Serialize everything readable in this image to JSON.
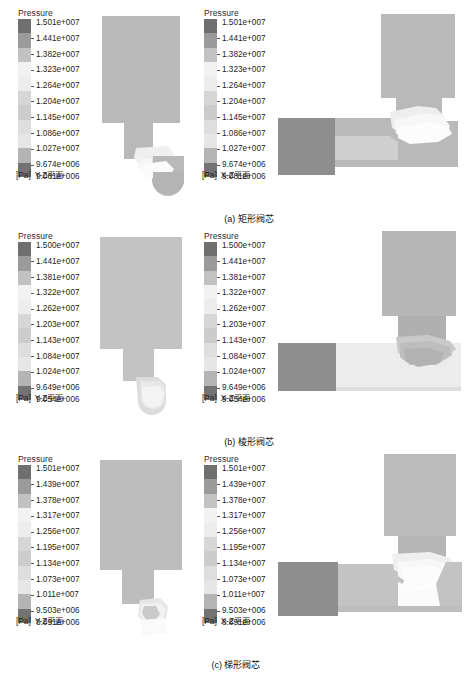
{
  "figure": {
    "type": "cfd-pressure-contour-figure",
    "rows": [
      {
        "id": "a",
        "caption": "(a) 矩形阀芯",
        "panels": [
          {
            "view": "Y-Z平面",
            "unit": "[Pa]",
            "legend_title": "Pressure",
            "levels": [
              "1.501e+007",
              "1.441e+007",
              "1.382e+007",
              "1.323e+007",
              "1.264e+007",
              "1.204e+007",
              "1.145e+007",
              "1.086e+007",
              "1.027e+007",
              "9.674e+006",
              "9.081e+006"
            ]
          },
          {
            "view": "X-Z平面",
            "unit": "[Pa]",
            "legend_title": "Pressure",
            "levels": [
              "1.501e+007",
              "1.441e+007",
              "1.382e+007",
              "1.323e+007",
              "1.264e+007",
              "1.204e+007",
              "1.145e+007",
              "1.086e+007",
              "1.027e+007",
              "9.674e+006",
              "9.081e+006"
            ]
          }
        ]
      },
      {
        "id": "b",
        "caption": "(b) 棱形阀芯",
        "panels": [
          {
            "view": "Y-Z平面",
            "unit": "[Pa]",
            "legend_title": "Pressure",
            "levels": [
              "1.500e+007",
              "1.441e+007",
              "1.381e+007",
              "1.322e+007",
              "1.262e+007",
              "1.203e+007",
              "1.143e+007",
              "1.084e+007",
              "1.024e+007",
              "9.649e+006",
              "9.054e+006"
            ]
          },
          {
            "view": "X-Z平面",
            "unit": "[Pa]",
            "legend_title": "Pressure",
            "levels": [
              "1.500e+007",
              "1.441e+007",
              "1.381e+007",
              "1.322e+007",
              "1.262e+007",
              "1.203e+007",
              "1.143e+007",
              "1.084e+007",
              "1.024e+007",
              "9.649e+006",
              "9.054e+006"
            ]
          }
        ]
      },
      {
        "id": "c",
        "caption": "(c) 梯形阀芯",
        "panels": [
          {
            "view": "Y-Z平面",
            "unit": "[Pa]",
            "legend_title": "Pressure",
            "levels": [
              "1.501e+007",
              "1.439e+007",
              "1.378e+007",
              "1.317e+007",
              "1.256e+007",
              "1.195e+007",
              "1.134e+007",
              "1.073e+007",
              "1.011e+007",
              "9.503e+006",
              "8.891e+006"
            ]
          },
          {
            "view": "X-Z平面",
            "unit": "[Pa]",
            "legend_title": "Pressure",
            "levels": [
              "1.501e+007",
              "1.439e+007",
              "1.378e+007",
              "1.317e+007",
              "1.256e+007",
              "1.195e+007",
              "1.134e+007",
              "1.073e+007",
              "1.011e+007",
              "9.503e+006",
              "8.891e+006"
            ]
          }
        ]
      }
    ],
    "colorbar_swatches": [
      "#6f6f6f",
      "#9b9b9b",
      "#c2c2c2",
      "#f2f2f2",
      "#ededed",
      "#d6d6d6",
      "#cccccc",
      "#dedede",
      "#e6e6e6",
      "#b4b4b4",
      "#737373"
    ],
    "body_fill": "#b9b9b9",
    "inlet_fill": "#8e8e8e",
    "throat_fill": "#ededed",
    "mid_fill": "#cfcfcf"
  },
  "chart_data": {
    "type": "heatmap",
    "title": "",
    "xlabel": "",
    "ylabel": "",
    "subplots": [
      {
        "label": "(a) 矩形阀芯 — Y-Z平面",
        "variable": "Pressure",
        "unit": "Pa",
        "contour_levels": [
          15010000,
          14410000,
          13820000,
          13230000,
          12640000,
          12040000,
          11450000,
          10860000,
          10270000,
          9674000,
          9081000
        ],
        "range": [
          9081000,
          15010000
        ]
      },
      {
        "label": "(a) 矩形阀芯 — X-Z平面",
        "variable": "Pressure",
        "unit": "Pa",
        "contour_levels": [
          15010000,
          14410000,
          13820000,
          13230000,
          12640000,
          12040000,
          11450000,
          10860000,
          10270000,
          9674000,
          9081000
        ],
        "range": [
          9081000,
          15010000
        ]
      },
      {
        "label": "(b) 棱形阀芯 — Y-Z平面",
        "variable": "Pressure",
        "unit": "Pa",
        "contour_levels": [
          15000000,
          14410000,
          13810000,
          13220000,
          12620000,
          12030000,
          11430000,
          10840000,
          10240000,
          9649000,
          9054000
        ],
        "range": [
          9054000,
          15000000
        ]
      },
      {
        "label": "(b) 棱形阀芯 — X-Z平面",
        "variable": "Pressure",
        "unit": "Pa",
        "contour_levels": [
          15000000,
          14410000,
          13810000,
          13220000,
          12620000,
          12030000,
          11430000,
          10840000,
          10240000,
          9649000,
          9054000
        ],
        "range": [
          9054000,
          15000000
        ]
      },
      {
        "label": "(c) 梯形阀芯 — Y-Z平面",
        "variable": "Pressure",
        "unit": "Pa",
        "contour_levels": [
          15010000,
          14390000,
          13780000,
          13170000,
          12560000,
          11950000,
          11340000,
          10730000,
          10110000,
          9503000,
          8891000
        ],
        "range": [
          8891000,
          15010000
        ]
      },
      {
        "label": "(c) 梯形阀芯 — X-Z平面",
        "variable": "Pressure",
        "unit": "Pa",
        "contour_levels": [
          15010000,
          14390000,
          13780000,
          13170000,
          12560000,
          11950000,
          11340000,
          10730000,
          10110000,
          9503000,
          8891000
        ],
        "range": [
          8891000,
          15010000
        ]
      }
    ],
    "colormap": "grayscale-banded",
    "legend_position": "left-of-each-panel",
    "grid": false
  }
}
